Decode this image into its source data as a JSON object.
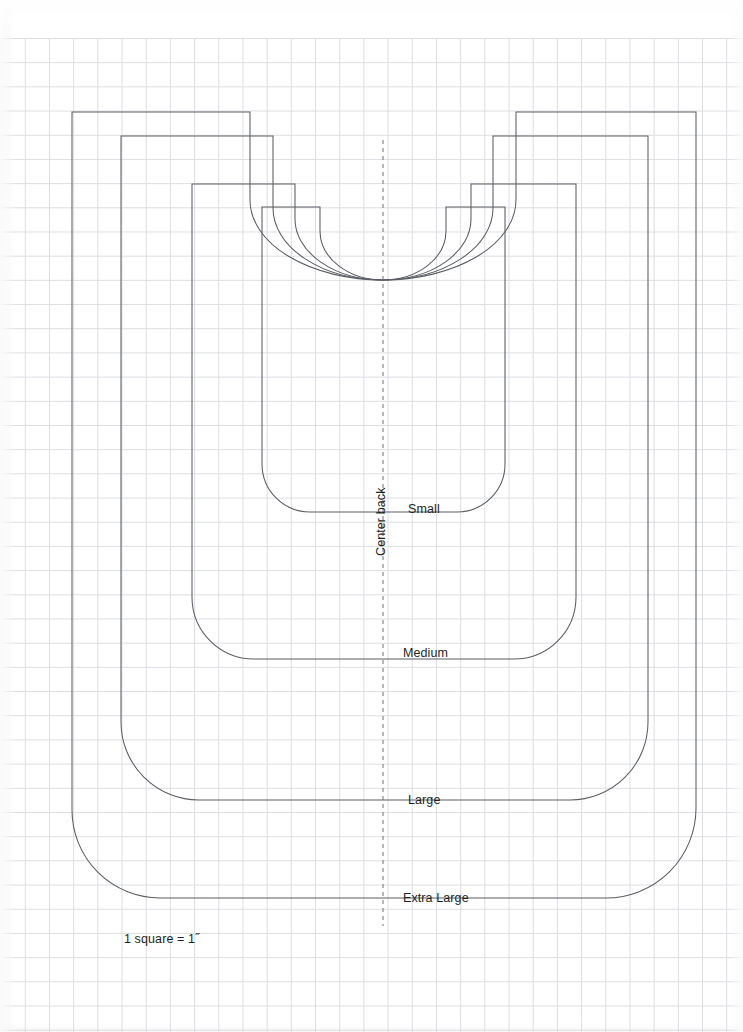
{
  "document": {
    "kind": "sewing-pattern-size-chart",
    "background_color": "#ffffff",
    "line_color": "#5a5d63",
    "grid_color": "#d2d4d9",
    "text_color": "#1d1f22"
  },
  "grid": {
    "square_size_px": 24.2,
    "scale_note": "1 square = 1˝",
    "origin_y_px": 38
  },
  "labels": {
    "center_back": "Center back",
    "scale": "1 square = 1˝",
    "sizes": [
      {
        "name": "Small",
        "x": 408,
        "y": 509
      },
      {
        "name": "Medium",
        "x": 403,
        "y": 653
      },
      {
        "name": "Large",
        "x": 408,
        "y": 800
      },
      {
        "name": "Extra Large",
        "x": 403,
        "y": 894
      }
    ],
    "center_back_pos": {
      "x": 372,
      "y": 556
    },
    "scale_pos": {
      "x": 124,
      "y": 933
    }
  },
  "fold_line": {
    "name": "center-back-fold",
    "x": 383,
    "y_top": 140,
    "y_bottom": 926
  },
  "shapes": [
    {
      "size": "Extra Large",
      "left": 72,
      "right": 696,
      "top": 112,
      "bottom": 898,
      "shoulder_y": 280,
      "neck_half_width": 133,
      "corner_radius": 88
    },
    {
      "size": "Large",
      "left": 121,
      "right": 648,
      "top": 136,
      "bottom": 800,
      "shoulder_y": 280,
      "neck_half_width": 110,
      "corner_radius": 78
    },
    {
      "size": "Medium",
      "left": 192,
      "right": 576,
      "top": 184,
      "bottom": 659,
      "shoulder_y": 280,
      "neck_half_width": 88,
      "corner_radius": 62
    },
    {
      "size": "Small",
      "left": 262,
      "right": 505,
      "top": 207,
      "bottom": 512,
      "shoulder_y": 280,
      "neck_half_width": 63,
      "corner_radius": 48
    }
  ]
}
